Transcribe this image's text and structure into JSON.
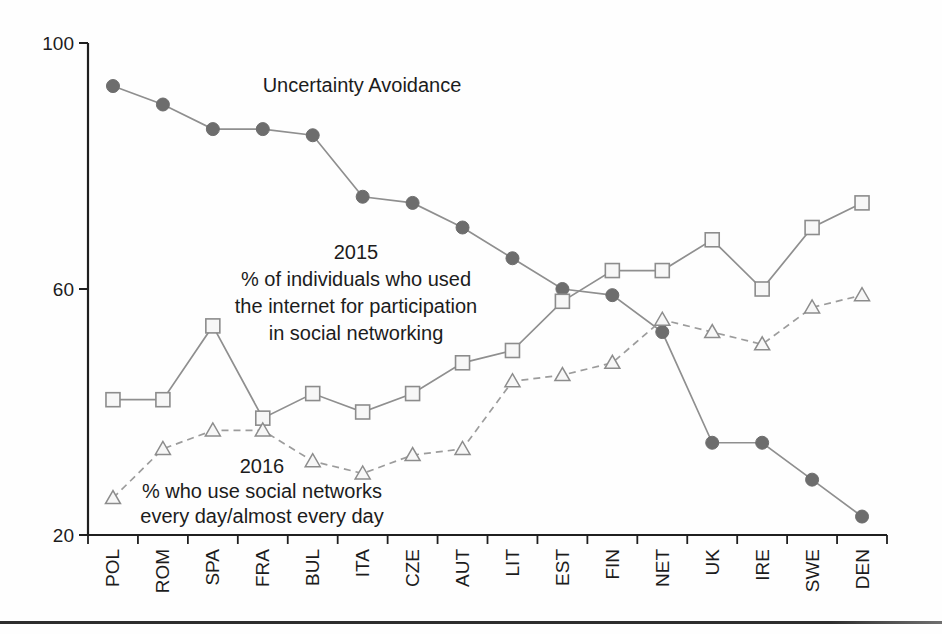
{
  "chart_data": {
    "type": "line",
    "categories": [
      "POL",
      "ROM",
      "SPA",
      "FRA",
      "BUL",
      "ITA",
      "CZE",
      "AUT",
      "LIT",
      "EST",
      "FIN",
      "NET",
      "UK",
      "IRE",
      "SWE",
      "DEN"
    ],
    "series": [
      {
        "name": "Uncertainty Avoidance",
        "marker": "circle-filled",
        "line": "solid",
        "values": [
          93,
          90,
          86,
          86,
          85,
          75,
          74,
          70,
          65,
          60,
          59,
          53,
          35,
          35,
          29,
          23
        ]
      },
      {
        "name": "2015 % of individuals who used the internet for participation in social networking",
        "marker": "square-open",
        "line": "solid",
        "values": [
          42,
          42,
          54,
          39,
          43,
          40,
          43,
          48,
          50,
          58,
          63,
          63,
          68,
          60,
          70,
          74
        ]
      },
      {
        "name": "2016 % who use social networks every day/almost every day",
        "marker": "triangle-open",
        "line": "dashed",
        "values": [
          26,
          34,
          37,
          37,
          32,
          30,
          33,
          34,
          45,
          46,
          48,
          55,
          53,
          51,
          57,
          59
        ]
      }
    ],
    "title": "",
    "xlabel": "",
    "ylabel": "",
    "ylim": [
      20,
      100
    ],
    "yticks": [
      100,
      60,
      20
    ],
    "grid": false,
    "legend_position": "inline-annotations"
  },
  "annotations": {
    "ua_label": "Uncertainty Avoidance",
    "label_2015": "2015\n% of individuals who used\nthe internet for participation\nin social networking",
    "label_2016": "2016\n% who use social networks\nevery day/almost every day"
  },
  "colors": {
    "axis": "#1f1f1f",
    "text": "#1c1c1c",
    "line_gray": "#8f8f8f",
    "dashed_gray": "#9c9c9c",
    "circle_fill": "#6d6d6d",
    "open_marker_fill": "#f7f7f7",
    "open_marker_stroke": "#8c8c8c",
    "bottom_rule": "#2d2d2d"
  }
}
